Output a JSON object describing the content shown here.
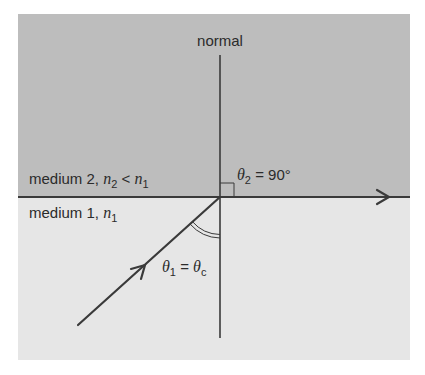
{
  "diagram": {
    "colors": {
      "background": "#ffffff",
      "medium2_fill": "#bdbdbd",
      "medium1_fill": "#e6e6e6",
      "line": "#3a3a3a"
    },
    "labels": {
      "normal": "normal",
      "medium2_prefix": "medium 2, ",
      "medium2_n": "n",
      "medium2_n_sub": "2",
      "medium2_lt": " < ",
      "medium2_n1": "n",
      "medium2_n1_sub": "1",
      "medium1_prefix": "medium 1, ",
      "medium1_n": "n",
      "medium1_n_sub": "1",
      "theta2_symbol": "θ",
      "theta2_sub": "2",
      "theta2_value": " = 90°",
      "theta1_symbol": "θ",
      "theta1_sub": "1",
      "theta1_eq": " = ",
      "thetac_symbol": "θ",
      "thetac_sub": "c"
    },
    "elements": {
      "interface_line": "horizontal boundary between medium 2 (top) and medium 1 (bottom)",
      "normal_line": "vertical normal through point of incidence",
      "incident_ray": "ray from lower-left toward interface at critical angle",
      "refracted_ray": "ray travelling along interface to the right (θ2 = 90°)",
      "right_angle_marker": "square marker between normal and refracted ray",
      "angle_arc": "double arc marking θ1 between incident ray and normal"
    }
  }
}
